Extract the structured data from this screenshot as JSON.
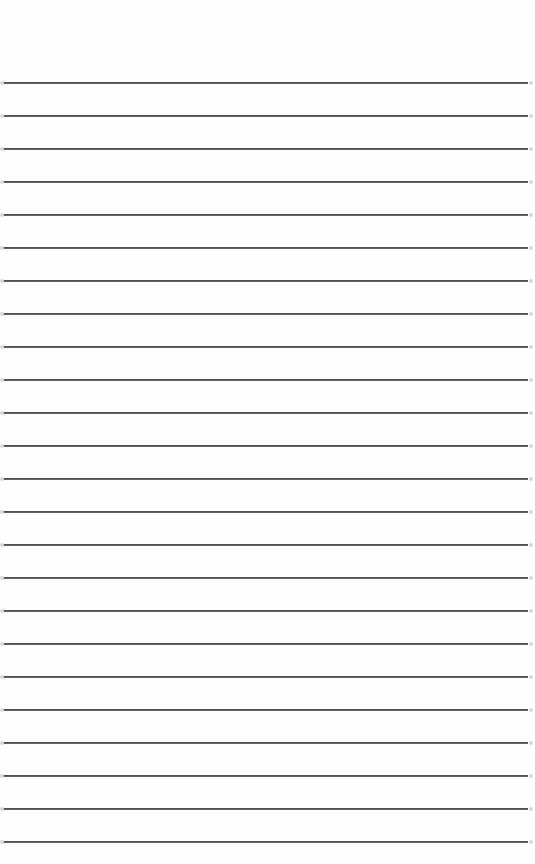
{
  "page": {
    "type": "lined-paper",
    "background": "#fefefe",
    "line_color": "#3a3a3a",
    "first_line_y": 83,
    "line_spacing": 33,
    "line_count": 24,
    "line_left": 3,
    "line_right": 528
  }
}
